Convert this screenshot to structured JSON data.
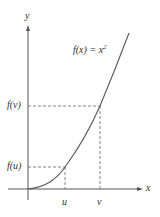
{
  "figure": {
    "function_label": "f(x) = x",
    "exponent": "2",
    "y_axis_label": "y",
    "x_axis_label": "x",
    "f_v_label": "f(v)",
    "f_u_label": "f(u)",
    "u_label": "u",
    "v_label": "v",
    "colors": {
      "curve": "#555555",
      "axis": "#444444",
      "dash": "#555555"
    }
  }
}
